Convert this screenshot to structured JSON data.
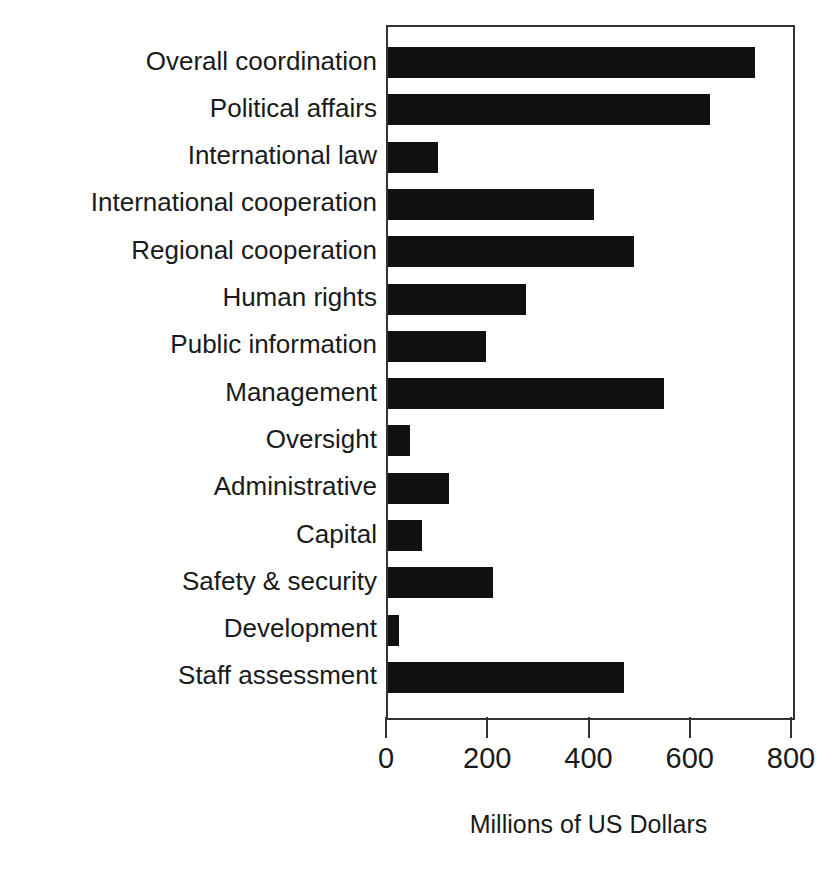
{
  "chart_data": {
    "type": "bar",
    "orientation": "horizontal",
    "title": "",
    "subtitle": "",
    "xlabel": "Millions of US Dollars",
    "ylabel": "",
    "xlim": [
      0,
      800
    ],
    "xticks": [
      0,
      200,
      400,
      600,
      800
    ],
    "xtick_labels": [
      "0",
      "200",
      "400",
      "600",
      "800"
    ],
    "grid": false,
    "legend": null,
    "bar_color": "#111111",
    "frame_color": "#333333",
    "background": "#ffffff",
    "categories": [
      "Overall coordination",
      "Political affairs",
      "International law",
      "International cooperation",
      "Regional cooperation",
      "Human rights",
      "Public information",
      "Management",
      "Oversight",
      "Administrative",
      "Capital",
      "Safety & security",
      "Development",
      "Staff assessment"
    ],
    "values": [
      725,
      636,
      99,
      407,
      486,
      273,
      194,
      545,
      44,
      120,
      67,
      207,
      21,
      466
    ]
  }
}
